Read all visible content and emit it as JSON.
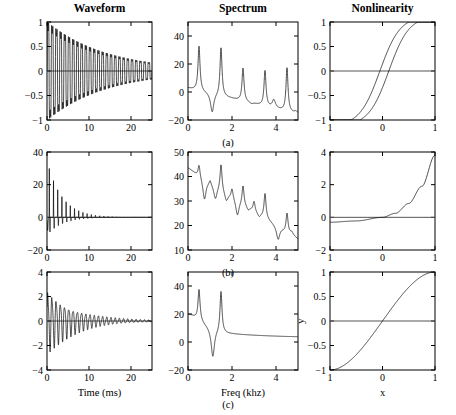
{
  "figure": {
    "column_titles": [
      "Waveform",
      "Spectrum",
      "Nonlinearity"
    ],
    "row_labels": [
      "(a)",
      "(b)",
      "(c)"
    ],
    "axis_labels": {
      "time": "Time (ms)",
      "freq": "Freq (khz)",
      "x": "x",
      "y": "y"
    },
    "line_color": "#000000",
    "zero_line_color": "#555555"
  },
  "chart_data": [
    {
      "id": "waveform-a",
      "type": "line",
      "row": "(a)",
      "column": "Waveform",
      "title": "Waveform",
      "xlabel": "",
      "ylabel": "",
      "xlim": [
        0,
        25
      ],
      "ylim": [
        -1,
        1
      ],
      "xticks": [
        0,
        10,
        20
      ],
      "xticklabels": [
        "0",
        "10",
        "20"
      ],
      "yticks": [
        -1,
        -0.5,
        0,
        0.5,
        1
      ],
      "yticklabels": [
        "-1",
        "-0.5",
        "0",
        "0.5",
        "1"
      ],
      "grid": false,
      "zero_line": true,
      "model": {
        "kind": "damped_oscillation_clipped",
        "frequency_khz": 1.0,
        "decay_tau_ms": 14.0,
        "amplitude": 0.95,
        "description": "Heavily clipped/saturated decaying oscillation, ~25 cycles over 25 ms, asymmetric peaks near +0.75 and troughs near -0.9 early, decaying to near +-0.15 at 25 ms"
      }
    },
    {
      "id": "spectrum-a",
      "type": "line",
      "row": "(a)",
      "column": "Spectrum",
      "title": "Spectrum",
      "xlabel": "",
      "ylabel": "",
      "xlim": [
        0,
        5
      ],
      "ylim": [
        -20,
        50
      ],
      "xticks": [
        0,
        2,
        4
      ],
      "xticklabels": [
        "0",
        "2",
        "4"
      ],
      "yticks": [
        -20,
        0,
        20,
        40
      ],
      "yticklabels": [
        "-20",
        "0",
        "20",
        "40"
      ],
      "grid": false,
      "zero_line": false,
      "peaks": [
        {
          "freq_khz": 0.5,
          "level_db": 33
        },
        {
          "freq_khz": 1.5,
          "level_db": 32
        },
        {
          "freq_khz": 2.5,
          "level_db": 17
        },
        {
          "freq_khz": 3.5,
          "level_db": 15
        },
        {
          "freq_khz": 4.5,
          "level_db": 17
        }
      ],
      "notches": [
        {
          "freq_khz": 1.1,
          "level_db": -15
        },
        {
          "freq_khz": 2.9,
          "level_db": -9
        },
        {
          "freq_khz": 3.9,
          "level_db": -6
        },
        {
          "freq_khz": 4.9,
          "level_db": -14
        }
      ],
      "start_level_db": 3,
      "description": "Harmonic comb with resonant peaks every 1 kHz starting at 0.5 kHz, peak level falling from 33 dB to about 15 dB, deep notches between peaks"
    },
    {
      "id": "nonlinearity-a",
      "type": "line",
      "row": "(a)",
      "column": "Nonlinearity",
      "title": "Nonlinearity",
      "xlabel": "",
      "ylabel": "",
      "xlim": [
        -1,
        1
      ],
      "ylim": [
        -1,
        1
      ],
      "xticks": [
        -1,
        0,
        1
      ],
      "xticklabels": [
        "1",
        "0",
        "1"
      ],
      "yticks": [
        -1,
        -0.5,
        0,
        0.5,
        1
      ],
      "yticklabels": [
        "-1",
        "-0.5",
        "0",
        "0.5",
        "1"
      ],
      "grid": false,
      "zero_line": true,
      "shape": "hysteresis_saturation",
      "description": "Hysteresis loop: two saturating S-shaped branches, lower branch crosses zero near x=-0.05, upper branch crosses near x=+0.1, both clip flat at -1 and +1"
    },
    {
      "id": "waveform-b",
      "type": "line",
      "row": "(b)",
      "column": "Waveform",
      "title": "",
      "xlabel": "",
      "ylabel": "",
      "xlim": [
        0,
        25
      ],
      "ylim": [
        -20,
        40
      ],
      "xticks": [
        0,
        10,
        20
      ],
      "xticklabels": [
        "0",
        "10",
        "20"
      ],
      "yticks": [
        -20,
        0,
        20,
        40
      ],
      "yticklabels": [
        "-20",
        "0",
        "20",
        "40"
      ],
      "grid": false,
      "zero_line": true,
      "model": {
        "kind": "impulsive_spikes",
        "spike_period_ms": 1.0,
        "first_spike_amp": 30,
        "decay_tau_ms": 3.5,
        "description": "Sharp positive impulse spikes at ~1 ms intervals: 30, 19, 12, 9, 6, 4 ... decaying to near zero by 15 ms, with a negative excursion to about -8 near t=1.5 ms"
      }
    },
    {
      "id": "spectrum-b",
      "type": "line",
      "row": "(b)",
      "column": "Spectrum",
      "title": "",
      "xlabel": "",
      "ylabel": "",
      "xlim": [
        0,
        5
      ],
      "ylim": [
        10,
        50
      ],
      "xticks": [
        0,
        2,
        4
      ],
      "xticklabels": [
        "0",
        "2",
        "4"
      ],
      "yticks": [
        10,
        20,
        30,
        40,
        50
      ],
      "yticklabels": [
        "10",
        "20",
        "30",
        "40",
        "50"
      ],
      "grid": false,
      "zero_line": false,
      "peaks": [
        {
          "freq_khz": 0.5,
          "level_db": 46
        },
        {
          "freq_khz": 1.0,
          "level_db": 40
        },
        {
          "freq_khz": 1.5,
          "level_db": 46
        },
        {
          "freq_khz": 2.0,
          "level_db": 36
        },
        {
          "freq_khz": 2.5,
          "level_db": 37
        },
        {
          "freq_khz": 3.0,
          "level_db": 30
        },
        {
          "freq_khz": 3.5,
          "level_db": 33
        },
        {
          "freq_khz": 4.5,
          "level_db": 25
        }
      ],
      "notches": [
        {
          "freq_khz": 0.75,
          "level_db": 31
        },
        {
          "freq_khz": 1.25,
          "level_db": 31
        },
        {
          "freq_khz": 1.75,
          "level_db": 30
        },
        {
          "freq_khz": 2.25,
          "level_db": 24
        },
        {
          "freq_khz": 2.75,
          "level_db": 26
        },
        {
          "freq_khz": 3.25,
          "level_db": 23
        },
        {
          "freq_khz": 4.1,
          "level_db": 14
        },
        {
          "freq_khz": 4.7,
          "level_db": 17
        }
      ],
      "start_level_db": 44,
      "description": "Dense harmonic comb at 0.5 kHz spacing, peak envelope falling from about 46 dB to 20 dB across 0 to 5 kHz"
    },
    {
      "id": "nonlinearity-b",
      "type": "line",
      "row": "(b)",
      "column": "Nonlinearity",
      "title": "",
      "xlabel": "",
      "ylabel": "",
      "xlim": [
        -1,
        1
      ],
      "ylim": [
        -2,
        4
      ],
      "xticks": [
        -1,
        0,
        1
      ],
      "xticklabels": [
        "1",
        "0",
        "1"
      ],
      "yticks": [
        -2,
        0,
        2,
        4
      ],
      "yticklabels": [
        "-2",
        "0",
        "2",
        "4"
      ],
      "grid": false,
      "zero_line": true,
      "shape": "exponential",
      "points": [
        {
          "x": -1,
          "y": -0.3
        },
        {
          "x": -0.5,
          "y": -0.22
        },
        {
          "x": 0,
          "y": 0.0
        },
        {
          "x": 0.25,
          "y": 0.25
        },
        {
          "x": 0.5,
          "y": 0.85
        },
        {
          "x": 0.75,
          "y": 1.9
        },
        {
          "x": 1,
          "y": 3.8
        }
      ],
      "description": "Smooth exponential / expansive curve, nearly flat at about -0.3 for x below -0.4, crossing zero at x=0, rising steeply to 3.8 at x=1"
    },
    {
      "id": "waveform-c",
      "type": "line",
      "row": "(c)",
      "column": "Waveform",
      "title": "",
      "xlabel": "Time (ms)",
      "ylabel": "",
      "xlim": [
        0,
        25
      ],
      "ylim": [
        -4,
        4
      ],
      "xticks": [
        0,
        10,
        20
      ],
      "xticklabels": [
        "0",
        "10",
        "20"
      ],
      "yticks": [
        -4,
        -2,
        0,
        2,
        4
      ],
      "yticklabels": [
        "-4",
        "-2",
        "0",
        "2",
        "4"
      ],
      "grid": false,
      "zero_line": true,
      "model": {
        "kind": "damped_oscillation",
        "frequency_khz": 1.0,
        "decay_tau_ms": 7.0,
        "amplitude": 2.4,
        "description": "Linear damped oscillation starting near +2.5 / -2.2 and decaying smoothly to about +-0.2 by 20 ms"
      }
    },
    {
      "id": "spectrum-c",
      "type": "line",
      "row": "(c)",
      "column": "Spectrum",
      "title": "",
      "xlabel": "Freq (khz)",
      "ylabel": "",
      "xlim": [
        0,
        5
      ],
      "ylim": [
        -20,
        50
      ],
      "xticks": [
        0,
        2,
        4
      ],
      "xticklabels": [
        "0",
        "2",
        "4"
      ],
      "yticks": [
        -20,
        0,
        20,
        40
      ],
      "yticklabels": [
        "-20",
        "0",
        "20",
        "40"
      ],
      "grid": false,
      "zero_line": false,
      "peaks": [
        {
          "freq_khz": 0.5,
          "level_db": 38
        },
        {
          "freq_khz": 1.5,
          "level_db": 37
        }
      ],
      "notches": [
        {
          "freq_khz": 1.13,
          "level_db": -11
        }
      ],
      "start_level_db": 10,
      "tail_level_db": 3,
      "description": "Two resonances at 0.5 and 1.5 kHz with a deep anti-resonance notch at about 1.15 kHz, smooth decaying tail from 20 dB down to 3 dB between 2 and 5 kHz"
    },
    {
      "id": "nonlinearity-c",
      "type": "line",
      "row": "(c)",
      "column": "Nonlinearity",
      "title": "",
      "xlabel": "x",
      "ylabel": "y",
      "xlim": [
        -1,
        1
      ],
      "ylim": [
        -1,
        1
      ],
      "xticks": [
        -1,
        0,
        1
      ],
      "xticklabels": [
        "1",
        "0",
        "1"
      ],
      "yticks": [
        -1,
        -0.5,
        0,
        0.5,
        1
      ],
      "yticklabels": [
        "-1",
        "-0.5",
        "0",
        "0.5",
        "1"
      ],
      "grid": false,
      "zero_line": true,
      "shape": "identity",
      "points": [
        {
          "x": -1,
          "y": -1
        },
        {
          "x": 1,
          "y": 1
        }
      ],
      "description": "Perfectly linear identity mapping y = x, no distortion"
    }
  ]
}
